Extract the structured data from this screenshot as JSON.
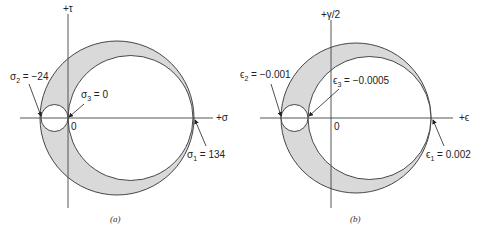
{
  "diagram": {
    "panels": [
      {
        "id": "a",
        "caption": "(a)",
        "axes": {
          "horizontal_label": "+σ",
          "vertical_label": "+τ",
          "origin_label": "0"
        },
        "labels": {
          "sigma2": {
            "symbol": "σ",
            "sub": "2",
            "text": " = −24"
          },
          "sigma3": {
            "symbol": "σ",
            "sub": "3",
            "text": " = 0"
          },
          "sigma1": {
            "symbol": "σ",
            "sub": "1",
            "text": " = 134"
          }
        },
        "principal_values": {
          "sigma1": 134,
          "sigma2": -24,
          "sigma3": 0
        }
      },
      {
        "id": "b",
        "caption": "(b)",
        "axes": {
          "horizontal_label": "+ϵ",
          "vertical_label": "+γ/2",
          "origin_label": "0"
        },
        "labels": {
          "eps2": {
            "symbol": "ϵ",
            "sub": "2",
            "text": " = −0.001"
          },
          "eps3": {
            "symbol": "ϵ",
            "sub": "3",
            "text": " = −0.0005"
          },
          "eps1": {
            "symbol": "ϵ",
            "sub": "1",
            "text": " = 0.002"
          }
        },
        "principal_values": {
          "eps1": 0.002,
          "eps2": -0.001,
          "eps3": -0.0005
        }
      }
    ],
    "colors": {
      "shade": "#d9d9d9",
      "line": "#333333",
      "background": "#ffffff"
    }
  }
}
